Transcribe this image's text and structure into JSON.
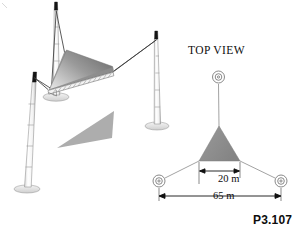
{
  "figure": {
    "tag": "P3.107",
    "top_view_label": "TOP VIEW",
    "dimensions": [
      {
        "id": "inner-span",
        "text": "20 m"
      },
      {
        "id": "outer-span",
        "text": "65 m"
      }
    ],
    "colors": {
      "canopy_fill": "#8c8c8c",
      "shadow_fill": "#a6a6a6",
      "line": "#4d4d4d",
      "dim_line": "#1a1a1a",
      "pole_fill": "#fbfbfb",
      "pole_cap": "#151515",
      "background": "#ffffff"
    },
    "perspective_view": {
      "description": "three-pole cable-stayed fabric canopy",
      "pole_count": 3,
      "poles": [
        {
          "id": "pole-left",
          "base_x": 27,
          "base_y": 188,
          "top_x": 34,
          "top_y": 77
        },
        {
          "id": "pole-center",
          "base_x": 56,
          "base_y": 96,
          "top_x": 55,
          "top_y": 4
        },
        {
          "id": "pole-right",
          "base_x": 157,
          "base_y": 125,
          "top_x": 155,
          "top_y": 33
        }
      ]
    },
    "top_view": {
      "anchor_count": 3,
      "anchors": [
        {
          "id": "anchor-top",
          "x": 218,
          "y": 77
        },
        {
          "id": "anchor-left",
          "x": 159,
          "y": 181
        },
        {
          "id": "anchor-right",
          "x": 281,
          "y": 181
        }
      ],
      "canopy_apex": {
        "x": 219,
        "y": 126
      },
      "canopy_base_left": {
        "x": 199,
        "y": 161
      },
      "canopy_base_right": {
        "x": 240,
        "y": 161
      }
    }
  }
}
